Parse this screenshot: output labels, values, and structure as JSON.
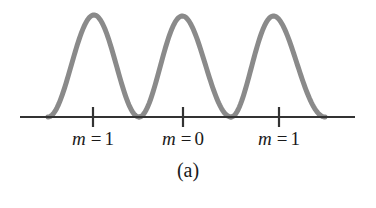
{
  "figure": {
    "caption": "(a)",
    "background_color": "#ffffff",
    "curve_color": "#8a8a8a",
    "axis_color": "#333333"
  },
  "axis": {
    "y": 117,
    "x_start": 20,
    "x_end": 355,
    "stroke_width": 2.2,
    "ticks": [
      {
        "x": 93,
        "label_symbol": "m",
        "label_equals": "=",
        "label_value": "1"
      },
      {
        "x": 183,
        "label_symbol": "m",
        "label_equals": "=",
        "label_value": "0"
      },
      {
        "x": 279,
        "label_symbol": "m",
        "label_equals": "=",
        "label_value": "1"
      }
    ],
    "tick_top": 107,
    "tick_bottom": 127
  },
  "chart_data": {
    "type": "line",
    "title": "",
    "subtitle": "",
    "xlabel": "",
    "ylabel": "",
    "xlim": [
      20,
      355
    ],
    "ylim": [
      0,
      1
    ],
    "grid": false,
    "legend": null,
    "annotations": [
      {
        "text": "m = 1",
        "x": 93,
        "y": 0
      },
      {
        "text": "m = 0",
        "x": 183,
        "y": 0
      },
      {
        "text": "m = 1",
        "x": 279,
        "y": 0
      }
    ],
    "series": [
      {
        "name": "intensity",
        "lobes": [
          {
            "zero_left": 48,
            "peak_x": 93,
            "peak_y": 15,
            "zero_right": 139,
            "peak_value": 1.0
          },
          {
            "zero_left": 139,
            "peak_x": 188,
            "peak_y": 16,
            "zero_right": 231,
            "peak_value": 0.99
          },
          {
            "zero_left": 231,
            "peak_x": 283,
            "peak_y": 16,
            "zero_right": 325,
            "peak_value": 0.99
          }
        ]
      }
    ]
  },
  "labels": [
    {
      "symbol": "m",
      "equals": "=",
      "value": "1",
      "center_x": 93
    },
    {
      "symbol": "m",
      "equals": "=",
      "value": "0",
      "center_x": 183
    },
    {
      "symbol": "m",
      "equals": "=",
      "value": "1",
      "center_x": 279
    }
  ]
}
